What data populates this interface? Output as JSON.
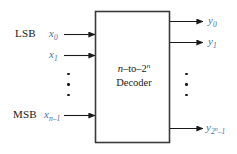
{
  "diagram": {
    "block": {
      "line1_prefix": "n",
      "line1_mid": "–to–",
      "line1_base": "2",
      "line1_exp": "n",
      "line2": "Decoder"
    },
    "colors": {
      "variable_blue": "#4a6fa5",
      "line_black": "#1a1a1a",
      "background": "#ffffff"
    },
    "inputs": [
      {
        "tag": "LSB",
        "var_base": "x",
        "var_sub": "0",
        "var_sub_exp": ""
      },
      {
        "tag": "",
        "var_base": "x",
        "var_sub": "1",
        "var_sub_exp": ""
      },
      {
        "tag": "MSB",
        "var_base": "x",
        "var_sub": "n–1",
        "var_sub_exp": ""
      }
    ],
    "outputs": [
      {
        "var_base": "y",
        "var_sub": "0",
        "var_sub_exp": ""
      },
      {
        "var_base": "y",
        "var_sub": "1",
        "var_sub_exp": ""
      },
      {
        "var_base": "y",
        "var_sub": "2",
        "var_sub_exp": "n",
        "var_sub_tail": "–1"
      }
    ],
    "ellipsis": {
      "left_label": "vertical-ellipsis",
      "right_label": "vertical-ellipsis",
      "dot_count": 3
    }
  }
}
